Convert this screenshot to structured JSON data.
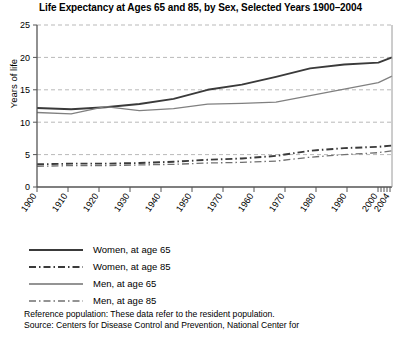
{
  "chart_data": {
    "type": "line",
    "title": "Life Expectancy at Ages 65 and 85, by Sex, Selected Years 1900–2004",
    "xlabel": "",
    "ylabel": "Years of life",
    "ylim": [
      0,
      25
    ],
    "yticks": [
      0,
      5,
      10,
      15,
      20,
      25
    ],
    "grid": true,
    "legend_position": "below-left",
    "x_tick_labels": [
      "1900",
      "1910",
      "1920",
      "1930",
      "1940",
      "1950",
      "1970",
      "1960",
      "1970",
      "1980",
      "1990",
      "2000",
      "2004"
    ],
    "x": [
      1900,
      1910,
      1920,
      1930,
      1940,
      1950,
      1960,
      1970,
      1980,
      1990,
      2000,
      2004
    ],
    "series": [
      {
        "name": "Women, at age 65",
        "style": "solid-thick",
        "color": "#3a3a3a",
        "values": [
          12.2,
          12.0,
          12.3,
          12.8,
          13.6,
          15.0,
          15.8,
          17.0,
          18.3,
          18.9,
          19.2,
          20.0
        ]
      },
      {
        "name": "Women, at age 85",
        "style": "dash-dot-thick",
        "color": "#3a3a3a",
        "values": [
          3.5,
          3.6,
          3.6,
          3.7,
          3.9,
          4.2,
          4.4,
          4.8,
          5.6,
          6.0,
          6.2,
          6.4
        ]
      },
      {
        "name": "Men, at age 65",
        "style": "solid-thin",
        "color": "#808080",
        "values": [
          11.5,
          11.3,
          12.4,
          11.8,
          12.1,
          12.8,
          12.9,
          13.1,
          14.1,
          15.1,
          16.1,
          17.1
        ]
      },
      {
        "name": "Men, at age 85",
        "style": "dash-dot-thin",
        "color": "#707070",
        "values": [
          3.2,
          3.3,
          3.3,
          3.4,
          3.5,
          3.7,
          3.8,
          4.0,
          4.6,
          5.0,
          5.3,
          5.6
        ]
      }
    ]
  },
  "legend": [
    {
      "label": "Women, at age 65",
      "swatch": "solid-thick"
    },
    {
      "label": "Women, at age 85",
      "swatch": "dash-dot-thick"
    },
    {
      "label": "Men, at age 65",
      "swatch": "solid-thin"
    },
    {
      "label": "Men, at age 85",
      "swatch": "dash-dot-thin"
    }
  ],
  "footnote": {
    "line1": "Reference population: These data refer to the resident population.",
    "line2": "Source: Centers for Disease Control and Prevention, National  Center for"
  }
}
